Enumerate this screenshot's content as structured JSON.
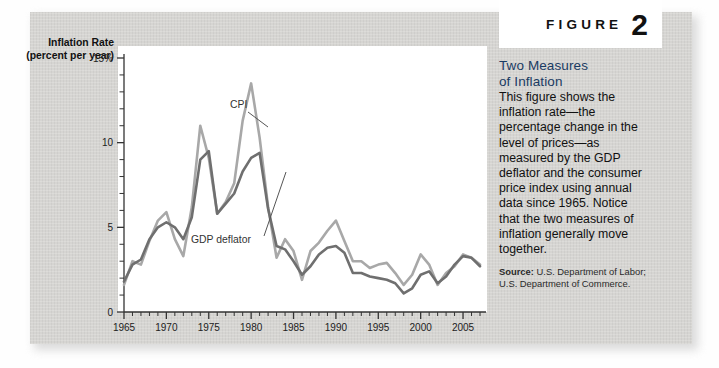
{
  "figure": {
    "word": "FIGURE",
    "number": "2"
  },
  "side_panel": {
    "title_line1": "Two Measures",
    "title_line2": "of Inflation",
    "body": "This figure shows the inflation rate—the percentage change in the level of prices—as measured by the GDP deflator and the consumer price index using annual data since 1965. Notice that the two measures of inflation generally move together.",
    "source_label": "Source:",
    "source_text": "U.S. Department of Labor; U.S. Department of Commerce."
  },
  "axis": {
    "y_title_line1": "Inflation Rate",
    "y_title_line2": "(percent per year)",
    "y_ticks": [
      "0",
      "5",
      "10",
      "15%"
    ],
    "x_ticks": [
      "1965",
      "1970",
      "1975",
      "1980",
      "1985",
      "1990",
      "1995",
      "2000",
      "2005"
    ]
  },
  "annotations": {
    "cpi": "CPI",
    "gdp": "GDP deflator"
  },
  "colors": {
    "card": "#d6d5d2",
    "cpi_line": "#a8a8a8",
    "gdp_line": "#6f6f6f",
    "title_blue": "#1a3b63",
    "axis": "#333333"
  },
  "chart_data": {
    "type": "line",
    "title": "Two Measures of Inflation",
    "xlabel": "",
    "ylabel": "Inflation Rate (percent per year)",
    "xlim": [
      1965,
      2007
    ],
    "ylim": [
      0,
      15
    ],
    "yticks": [
      0,
      5,
      10,
      15
    ],
    "xticks": [
      1965,
      1970,
      1975,
      1980,
      1985,
      1990,
      1995,
      2000,
      2005
    ],
    "grid": false,
    "legend": "inline annotations",
    "x": [
      1965,
      1966,
      1967,
      1968,
      1969,
      1970,
      1971,
      1972,
      1973,
      1974,
      1975,
      1976,
      1977,
      1978,
      1979,
      1980,
      1981,
      1982,
      1983,
      1984,
      1985,
      1986,
      1987,
      1988,
      1989,
      1990,
      1991,
      1992,
      1993,
      1994,
      1995,
      1996,
      1997,
      1998,
      1999,
      2000,
      2001,
      2002,
      2003,
      2004,
      2005,
      2006,
      2007
    ],
    "series": [
      {
        "name": "CPI",
        "color": "#a8a8a8",
        "values": [
          1.6,
          3.0,
          2.8,
          4.2,
          5.4,
          5.9,
          4.3,
          3.3,
          6.2,
          11.0,
          9.1,
          5.8,
          6.5,
          7.6,
          11.3,
          13.5,
          10.3,
          6.2,
          3.2,
          4.3,
          3.6,
          1.9,
          3.6,
          4.1,
          4.8,
          5.4,
          4.2,
          3.0,
          3.0,
          2.6,
          2.8,
          2.9,
          2.3,
          1.6,
          2.2,
          3.4,
          2.8,
          1.6,
          2.3,
          2.7,
          3.4,
          3.2,
          2.8
        ]
      },
      {
        "name": "GDP deflator",
        "color": "#6f6f6f",
        "values": [
          1.8,
          2.8,
          3.1,
          4.3,
          5.0,
          5.3,
          5.0,
          4.3,
          5.6,
          9.0,
          9.5,
          5.8,
          6.4,
          7.0,
          8.3,
          9.1,
          9.4,
          6.1,
          3.9,
          3.7,
          3.0,
          2.2,
          2.7,
          3.4,
          3.8,
          3.9,
          3.5,
          2.3,
          2.3,
          2.1,
          2.0,
          1.9,
          1.7,
          1.1,
          1.4,
          2.2,
          2.4,
          1.7,
          2.1,
          2.8,
          3.3,
          3.2,
          2.7
        ]
      }
    ]
  }
}
